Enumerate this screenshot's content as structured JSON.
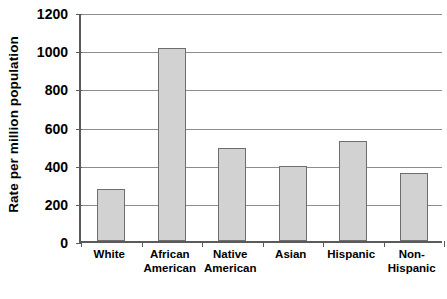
{
  "chart_data": {
    "type": "bar",
    "title": "",
    "xlabel": "",
    "ylabel": "Rate per million population",
    "categories": [
      "White",
      "African American",
      "Native American",
      "Asian",
      "Hispanic",
      "Non-Hispanic"
    ],
    "values": [
      275,
      1012,
      490,
      393,
      525,
      355
    ],
    "ylim": [
      0,
      1200
    ],
    "ytick_labels": [
      "0",
      "200",
      "400",
      "600",
      "800",
      "1000",
      "1200"
    ],
    "ytick_values": [
      0,
      200,
      400,
      600,
      800,
      1000,
      1200
    ],
    "grid": true,
    "legend": false,
    "bar_color": "#d2d2d2",
    "bar_border_color": "#6e6e6e",
    "grid_color": "#8c8c8c",
    "axis_color": "#5a5a5a",
    "background_color": "#ffffff"
  },
  "axis": {
    "y_title": "Rate per million population"
  }
}
